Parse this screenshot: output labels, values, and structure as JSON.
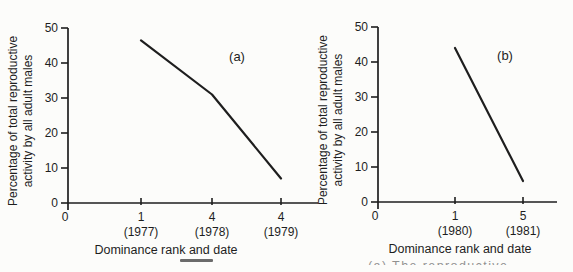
{
  "page": {
    "background": "#fcfcfa",
    "ink_color": "#1e1e1e"
  },
  "caption": {
    "fragment": "(a) The reproductive"
  },
  "chart_data": [
    {
      "type": "line",
      "panel_label": "(a)",
      "ylabel": "Percentage of total reproductive activity by all adult males",
      "ylabel_lines": [
        "Percentage of total reproductive",
        "activity by all adult males"
      ],
      "xlabel": "Dominance rank and date",
      "ylim": [
        0,
        50
      ],
      "yticks": [
        0,
        10,
        20,
        30,
        40,
        50
      ],
      "origin_label": "0",
      "x_categories": [
        {
          "rank": "1",
          "year": "(1977)"
        },
        {
          "rank": "4",
          "year": "(1978)"
        },
        {
          "rank": "4",
          "year": "(1979)"
        }
      ],
      "values_percent": [
        46.5,
        31,
        7
      ],
      "line_color": "#1e1e1e",
      "legend": "none",
      "grid": false
    },
    {
      "type": "line",
      "panel_label": "(b)",
      "ylabel": "Percentage of total reproductive activity by all adult males",
      "ylabel_lines": [
        "Percentage of total reproductive",
        "activity by all adult males"
      ],
      "xlabel": "Dominance rank and date",
      "ylim": [
        0,
        50
      ],
      "yticks": [
        0,
        10,
        20,
        30,
        40,
        50
      ],
      "origin_label": "0",
      "x_categories": [
        {
          "rank": "1",
          "year": "(1980)"
        },
        {
          "rank": "5",
          "year": "(1981)"
        }
      ],
      "values_percent": [
        44,
        6
      ],
      "line_color": "#1e1e1e",
      "legend": "none",
      "grid": false
    }
  ]
}
